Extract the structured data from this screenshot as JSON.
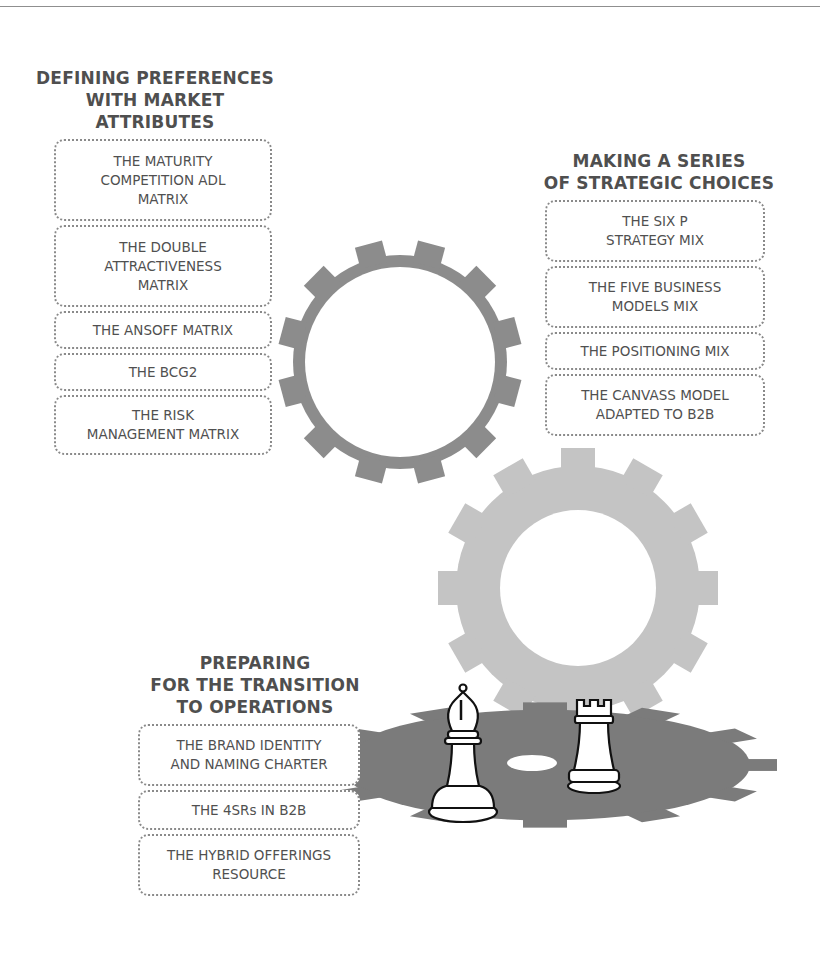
{
  "figure": {
    "groups": [
      {
        "title": "DEFINING PREFERENCES\nWITH MARKET\nATTRIBUTES",
        "items": [
          "THE MATURITY\nCOMPETITION ADL\nMATRIX",
          "THE DOUBLE\nATTRACTIVENESS\nMATRIX",
          "THE ANSOFF MATRIX",
          "THE BCG2",
          "THE RISK\nMANAGEMENT MATRIX"
        ]
      },
      {
        "title": "MAKING A SERIES\nOF STRATEGIC CHOICES",
        "items": [
          "THE SIX P\nSTRATEGY MIX",
          "THE FIVE BUSINESS\nMODELS MIX",
          "THE POSITIONING MIX",
          "THE CANVASS MODEL\nADAPTED TO B2B"
        ]
      },
      {
        "title": "PREPARING\nFOR THE TRANSITION\nTO OPERATIONS",
        "items": [
          "THE BRAND IDENTITY\nAND NAMING CHARTER",
          "THE 4SRs IN B2B",
          "THE HYBRID OFFERINGS\nRESOURCE"
        ]
      }
    ],
    "illustration": {
      "icons": [
        "gear-icon-dark",
        "gear-icon-light",
        "gear-icon-base",
        "chess-bishop-icon",
        "chess-rook-icon"
      ],
      "colors": {
        "gear_dark": "#8c8c8c",
        "gear_light": "#c4c4c4",
        "gear_base": "#7b7b7b",
        "text": "#505050",
        "border": "#8a8a8a"
      }
    }
  }
}
